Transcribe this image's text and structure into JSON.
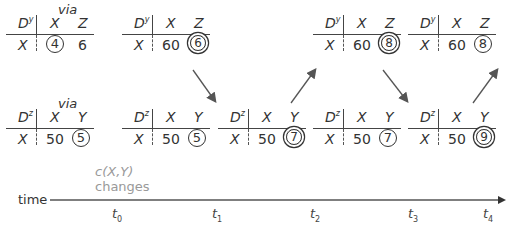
{
  "via_label": "via",
  "tables_y": [
    {
      "node": "D",
      "sup": "y",
      "cols": [
        "X",
        "Z"
      ],
      "row": "X",
      "v1": "4",
      "v2": "6",
      "mark1": "circle",
      "mark2": "none",
      "left": 6
    },
    {
      "node": "D",
      "sup": "y",
      "cols": [
        "X",
        "Z"
      ],
      "row": "X",
      "v1": "60",
      "v2": "6",
      "mark1": "none",
      "mark2": "double",
      "left": 122
    },
    {
      "node": "D",
      "sup": "y",
      "cols": [
        "X",
        "Z"
      ],
      "row": "X",
      "v1": "60",
      "v2": "8",
      "mark1": "none",
      "mark2": "double",
      "left": 313
    },
    {
      "node": "D",
      "sup": "y",
      "cols": [
        "X",
        "Z"
      ],
      "row": "X",
      "v1": "60",
      "v2": "8",
      "mark1": "none",
      "mark2": "circle",
      "left": 408
    }
  ],
  "tables_z": [
    {
      "node": "D",
      "sup": "z",
      "cols": [
        "X",
        "Y"
      ],
      "row": "X",
      "v1": "50",
      "v2": "5",
      "mark2": "circle",
      "left": 6
    },
    {
      "node": "D",
      "sup": "z",
      "cols": [
        "X",
        "Y"
      ],
      "row": "X",
      "v1": "50",
      "v2": "5",
      "mark2": "circle",
      "left": 122
    },
    {
      "node": "D",
      "sup": "z",
      "cols": [
        "X",
        "Y"
      ],
      "row": "X",
      "v1": "50",
      "v2": "7",
      "mark2": "double",
      "left": 218
    },
    {
      "node": "D",
      "sup": "z",
      "cols": [
        "X",
        "Y"
      ],
      "row": "X",
      "v1": "50",
      "v2": "7",
      "mark2": "circle",
      "left": 313
    },
    {
      "node": "D",
      "sup": "z",
      "cols": [
        "X",
        "Y"
      ],
      "row": "X",
      "v1": "50",
      "v2": "9",
      "mark2": "double",
      "left": 408
    }
  ],
  "note": {
    "line1": "c(X,Y)",
    "line2": "changes"
  },
  "timeline": {
    "label": "time",
    "ticks": [
      {
        "name": "t",
        "sub": "0",
        "x": 112
      },
      {
        "name": "t",
        "sub": "1",
        "x": 212
      },
      {
        "name": "t",
        "sub": "2",
        "x": 310
      },
      {
        "name": "t",
        "sub": "3",
        "x": 408
      },
      {
        "name": "t",
        "sub": "4",
        "x": 483
      }
    ]
  },
  "colors": {
    "ink": "#333333",
    "note": "#999999",
    "arrow": "#555555"
  }
}
